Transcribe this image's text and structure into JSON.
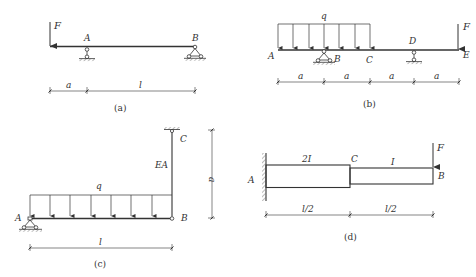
{
  "figures": {
    "a": {
      "caption": "(a)",
      "labels": {
        "force": "F",
        "support_a": "A",
        "support_b": "B"
      },
      "dimensions": [
        "a",
        "l"
      ]
    },
    "b": {
      "caption": "(b)",
      "labels": {
        "load": "q",
        "force": "F",
        "point_a": "A",
        "point_b": "B",
        "point_c": "C",
        "point_d": "D",
        "point_e": "E"
      },
      "dimensions": [
        "a",
        "a",
        "a",
        "a"
      ]
    },
    "c": {
      "caption": "(c)",
      "labels": {
        "load": "q",
        "rod": "EA",
        "point_a": "A",
        "point_b": "B",
        "point_c": "C"
      },
      "dimensions": {
        "horizontal": "l",
        "vertical": "a"
      }
    },
    "d": {
      "caption": "(d)",
      "labels": {
        "force": "F",
        "point_a": "A",
        "point_b": "B",
        "point_c": "C",
        "section_1": "2I",
        "section_2": "I"
      },
      "dimensions": [
        "l/2",
        "l/2"
      ]
    }
  },
  "colors": {
    "line": "#333333",
    "background": "#ffffff"
  }
}
